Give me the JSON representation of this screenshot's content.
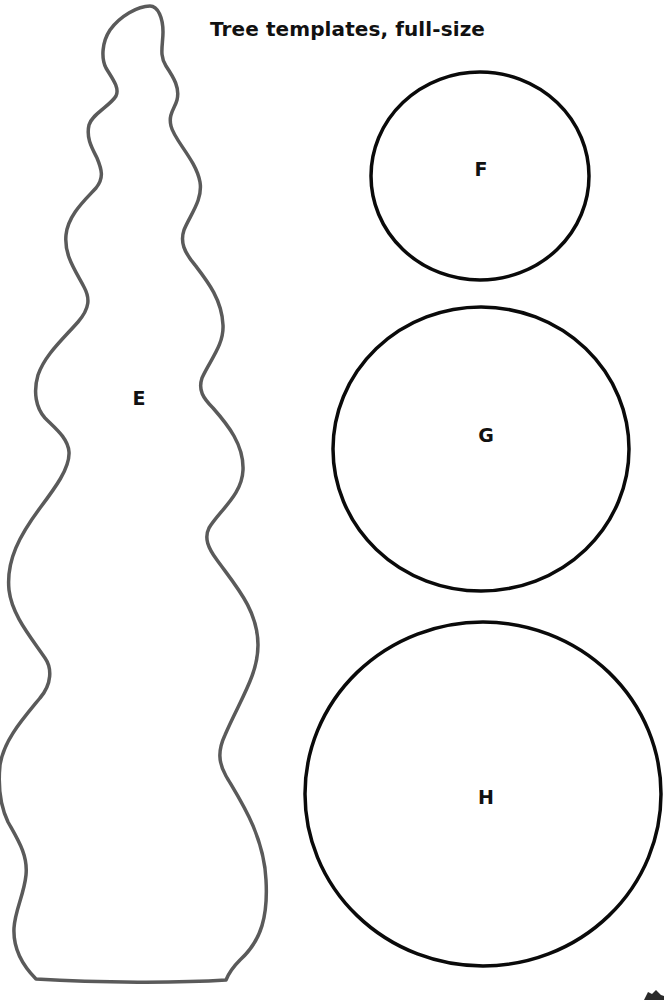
{
  "page": {
    "title": "Tree templates, full-size"
  },
  "templates": [
    {
      "id": "E",
      "label": "E",
      "shape": "wavy-tree-outline",
      "stroke_color": "#5a5a5a"
    },
    {
      "id": "F",
      "label": "F",
      "shape": "circle",
      "stroke_color": "#0a0a0a"
    },
    {
      "id": "G",
      "label": "G",
      "shape": "circle",
      "stroke_color": "#0a0a0a"
    },
    {
      "id": "H",
      "label": "H",
      "shape": "circle",
      "stroke_color": "#0a0a0a"
    }
  ],
  "colors": {
    "background": "#ffffff",
    "text": "#111111",
    "tree_outline": "#5a5a5a",
    "circle_outline": "#0a0a0a"
  }
}
